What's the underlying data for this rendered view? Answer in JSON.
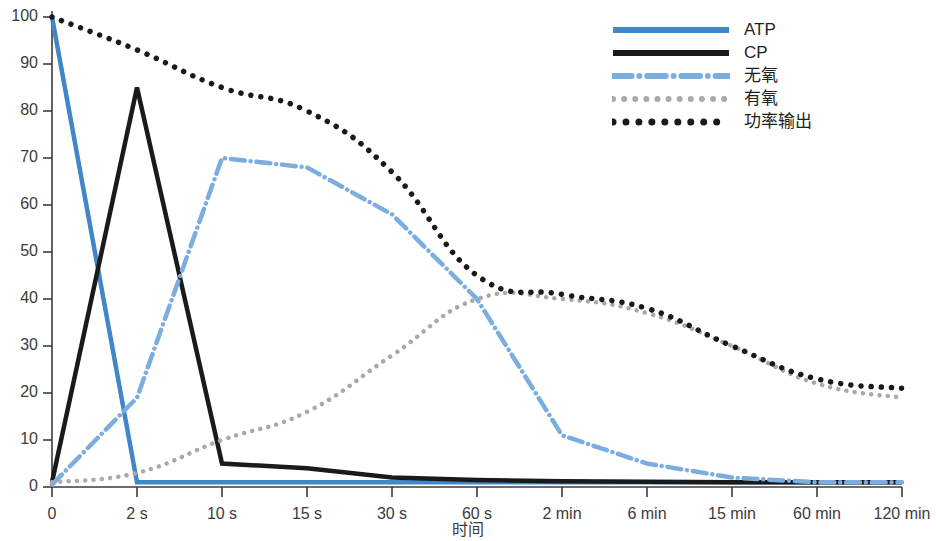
{
  "chart_data": {
    "type": "line",
    "title": "",
    "subtitle": "",
    "xlabel": "时间",
    "ylabel": "",
    "grid": false,
    "legend_position": "top-right",
    "xlim": [
      0,
      10
    ],
    "ylim": [
      0,
      100
    ],
    "categories": [
      "0",
      "2 s",
      "10 s",
      "15 s",
      "30 s",
      "60 s",
      "2 min",
      "6 min",
      "15 min",
      "60 min",
      "120 min"
    ],
    "yticks": [
      0,
      10,
      20,
      30,
      40,
      50,
      60,
      70,
      80,
      90,
      100
    ],
    "series": [
      {
        "name": "ATP",
        "color": "#3f87c9",
        "style": "solid",
        "width": 4.5,
        "values": [
          100,
          1,
          1,
          1,
          1,
          1,
          1,
          1,
          1,
          1,
          1
        ]
      },
      {
        "name": "CP",
        "color": "#1a1a1a",
        "style": "solid",
        "width": 4.5,
        "values": [
          1,
          85,
          5,
          4,
          2,
          1.5,
          1.2,
          1.1,
          1,
          1,
          1
        ]
      },
      {
        "name": "无氧",
        "color": "#7badde",
        "style": "dashdot",
        "width": 4.5,
        "values": [
          0.5,
          19,
          70,
          68,
          58,
          40,
          11,
          5,
          2,
          1,
          1
        ]
      },
      {
        "name": "有氧",
        "color": "#a9a9a9",
        "style": "dotted",
        "width": 4.5,
        "values": [
          1,
          3,
          10,
          16,
          28,
          40,
          40,
          37,
          30,
          22,
          19
        ]
      },
      {
        "name": "功率输出",
        "color": "#1a1a1a",
        "style": "dotted",
        "width": 5.5,
        "values": [
          100,
          93,
          85,
          80,
          67,
          45,
          41,
          38,
          30,
          23,
          21
        ]
      }
    ]
  },
  "legend": {
    "items": [
      {
        "label": "ATP"
      },
      {
        "label": "CP"
      },
      {
        "label": "无氧"
      },
      {
        "label": "有氧"
      },
      {
        "label": "功率输出"
      }
    ]
  },
  "axes": {
    "x_title": "时间",
    "x_tick_labels": [
      "0",
      "2 s",
      "10 s",
      "15 s",
      "30 s",
      "60 s",
      "2 min",
      "6 min",
      "15 min",
      "60 min",
      "120 min"
    ],
    "y_tick_labels": [
      "0",
      "10",
      "20",
      "30",
      "40",
      "50",
      "60",
      "70",
      "80",
      "90",
      "100"
    ]
  },
  "colors": {
    "atp_blue": "#3f87c9",
    "anaerobic_blue": "#7badde",
    "aerobic_gray": "#a9a9a9",
    "black": "#1a1a1a",
    "axis": "#3b3b3b",
    "background": "#ffffff"
  }
}
